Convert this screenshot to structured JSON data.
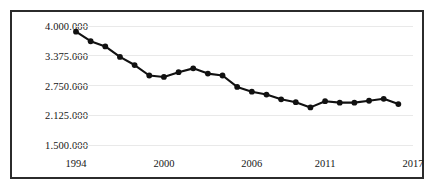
{
  "chart_data": {
    "type": "line",
    "title": "",
    "subtitle": "",
    "xlabel": "",
    "ylabel": "",
    "grid": true,
    "legend": null,
    "legend_position": "none",
    "xlim": [
      1994,
      2017
    ],
    "ylim": [
      1500000,
      4000000
    ],
    "x_tick_labels": [
      "1994",
      "2000",
      "2006",
      "2011",
      "2017"
    ],
    "x_tick_values": [
      1994,
      2000,
      2006,
      2011,
      2017
    ],
    "y_tick_labels": [
      "1.500.000",
      "2.125.000",
      "2.750.000",
      "3.375.000",
      "4.000.000"
    ],
    "y_tick_values": [
      1500000,
      2125000,
      2750000,
      3375000,
      4000000
    ],
    "x": [
      1994,
      1995,
      1996,
      1997,
      1998,
      1999,
      2000,
      2001,
      2002,
      2003,
      2004,
      2005,
      2006,
      2007,
      2008,
      2009,
      2010,
      2011,
      2012,
      2013,
      2014,
      2015,
      2016
    ],
    "values": [
      3880000,
      3680000,
      3570000,
      3350000,
      3180000,
      2960000,
      2930000,
      3030000,
      3110000,
      3000000,
      2960000,
      2720000,
      2620000,
      2560000,
      2460000,
      2400000,
      2290000,
      2420000,
      2390000,
      2390000,
      2430000,
      2470000,
      2360000
    ],
    "marker": "filled-circle",
    "line_color": "#111111",
    "marker_color": "#111111",
    "grid_color": "#e9e9e9",
    "border_color": "#2b2b2b"
  }
}
